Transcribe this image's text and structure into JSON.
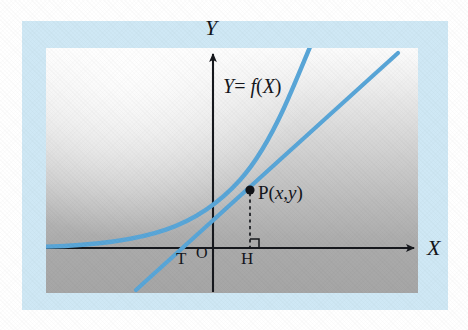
{
  "figure": {
    "kind": "math-diagram",
    "colors": {
      "curve_blue": "#59a6d8",
      "frame_blue": "#cfe8f5",
      "axis_black": "#16181d",
      "panel_gray_top": "#fcfcfc",
      "panel_gray_bottom": "#a6a6a6",
      "point_black": "#111318"
    }
  },
  "axes": {
    "x_label": "X",
    "y_label": "Y",
    "origin_label": "O"
  },
  "labels": {
    "function_label": "Y= f(X)",
    "point_label": "P(x,y)",
    "tangent_intercept_label": "T",
    "foot_label": "H"
  },
  "chart_data": {
    "type": "line",
    "title": "",
    "xlabel": "X",
    "ylabel": "Y",
    "grid": false,
    "legend": "none",
    "annotations": [
      {
        "name": "function_label",
        "text": "Y= f(X)",
        "x": 223,
        "y": 76
      },
      {
        "name": "point_label",
        "text": "P(x,y)",
        "x": 258,
        "y": 183
      },
      {
        "name": "origin_label",
        "text": "O",
        "x": 196,
        "y": 245
      },
      {
        "name": "tangent_intercept_label",
        "text": "T",
        "x": 176,
        "y": 250
      },
      {
        "name": "foot_label",
        "text": "H",
        "x": 241,
        "y": 250
      }
    ],
    "series": [
      {
        "name": "Y= f(X)",
        "type": "curve",
        "color": "#59a6d8",
        "points": [
          [
            48,
            246
          ],
          [
            70,
            245
          ],
          [
            92,
            243
          ],
          [
            112,
            241
          ],
          [
            132,
            238
          ],
          [
            150,
            234
          ],
          [
            166,
            229
          ],
          [
            180,
            224
          ],
          [
            196,
            216
          ],
          [
            210,
            207
          ],
          [
            222,
            198
          ],
          [
            234,
            188
          ],
          [
            244,
            178
          ],
          [
            252,
            168
          ],
          [
            262,
            154
          ],
          [
            272,
            136
          ],
          [
            282,
            114
          ],
          [
            292,
            90
          ],
          [
            300,
            70
          ],
          [
            308,
            50
          ]
        ]
      },
      {
        "name": "tangent",
        "type": "line",
        "color": "#59a6d8",
        "points": [
          [
            140,
            286
          ],
          [
            185,
            248
          ],
          [
            250,
            190
          ],
          [
            394,
            57
          ]
        ]
      }
    ],
    "markers": [
      {
        "name": "point-P",
        "x": 250,
        "y": 190,
        "color": "#111318",
        "radius": 4.5
      }
    ],
    "guides": [
      {
        "name": "perpendicular-PH",
        "style": "dashed",
        "from": [
          250,
          190
        ],
        "to": [
          250,
          248
        ]
      }
    ]
  }
}
